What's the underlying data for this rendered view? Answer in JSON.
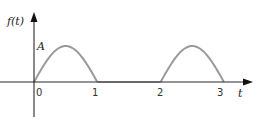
{
  "chart_data": {
    "type": "line",
    "title": "",
    "xlabel": "t",
    "ylabel": "f(t)",
    "amplitude_label": "A",
    "x_ticks": [
      "0",
      "1",
      "2",
      "3"
    ],
    "xlim": [
      -0.55,
      3.5
    ],
    "ylim": [
      -0.9,
      1.0
    ],
    "series": [
      {
        "name": "f(t)",
        "pulses": [
          {
            "start": 0,
            "end": 1,
            "amplitude": 1
          },
          {
            "start": 2,
            "end": 3,
            "amplitude": 1
          }
        ],
        "zero_segments": [
          {
            "start": 1,
            "end": 2
          }
        ]
      }
    ],
    "colors": {
      "signal": "#9a9a9a",
      "axis": "#2a2a2a"
    }
  }
}
